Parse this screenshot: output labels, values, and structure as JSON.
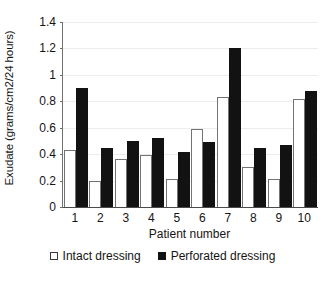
{
  "chart_data": {
    "type": "bar",
    "title": "",
    "xlabel": "Patient number",
    "ylabel": "Exudate (grams/cm2/24 hours)",
    "categories": [
      "1",
      "2",
      "3",
      "4",
      "5",
      "6",
      "7",
      "8",
      "9",
      "10"
    ],
    "series": [
      {
        "name": "Intact dressing",
        "color": "#ffffff",
        "values": [
          0.43,
          0.2,
          0.36,
          0.39,
          0.21,
          0.59,
          0.83,
          0.3,
          0.21,
          0.82
        ]
      },
      {
        "name": "Perforated dressing",
        "color": "#111111",
        "values": [
          0.9,
          0.45,
          0.5,
          0.52,
          0.42,
          0.49,
          1.2,
          0.45,
          0.47,
          0.88
        ]
      }
    ],
    "ylim": [
      0,
      1.4
    ],
    "yticks": [
      0,
      0.2,
      0.4,
      0.6,
      0.8,
      1,
      1.2,
      1.4
    ],
    "ytick_labels": [
      "0",
      "0.2",
      "0.4",
      "0.6",
      "0.8",
      "1",
      "1.2",
      "1.4"
    ],
    "grid": true,
    "legend_position": "bottom"
  },
  "legend": {
    "entries": [
      {
        "label": "Intact dressing",
        "swatch": "white-square-icon"
      },
      {
        "label": "Perforated dressing",
        "swatch": "black-square-icon"
      }
    ]
  }
}
